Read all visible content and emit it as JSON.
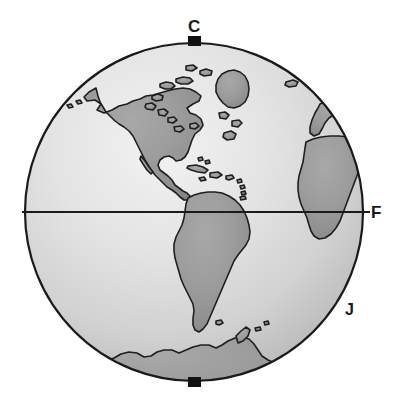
{
  "figure": {
    "type": "globe-diagram",
    "background_color": "#ffffff"
  },
  "globe": {
    "center_x": 194,
    "center_y": 212,
    "radius": 170,
    "ocean_color_light": "#ececec",
    "ocean_color_dark": "#b0b0b0",
    "land_color": "#9a9a9a",
    "land_shadow_color": "#868686",
    "outline_color": "#1a1a1a",
    "outline_width": 2
  },
  "equator": {
    "y": 212,
    "x_start": 22,
    "x_end": 370,
    "color": "#1a1a1a",
    "width": 2
  },
  "axis_pins": {
    "color": "#111111",
    "top": {
      "x": 188,
      "y": 36,
      "width": 13,
      "height": 9
    },
    "bottom": {
      "x": 188,
      "y": 377,
      "width": 13,
      "height": 9
    }
  },
  "labels": {
    "top": "C",
    "right": "F",
    "lower_right": "J"
  },
  "label_colors": {
    "text": "#1a1a1a"
  }
}
